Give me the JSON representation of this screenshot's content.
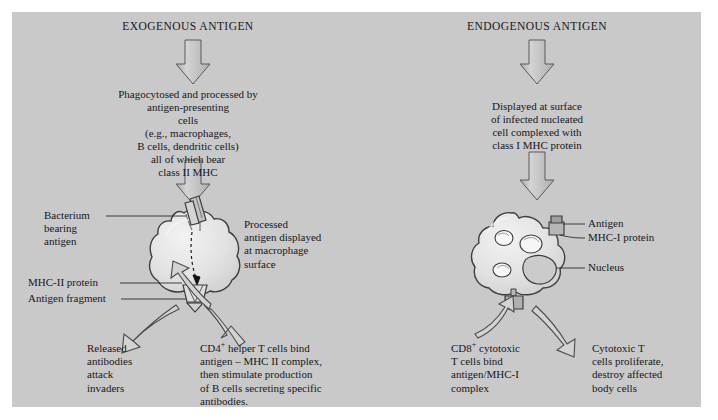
{
  "figure": {
    "background_color": "#c9c9c9",
    "page_color": "#ffffff",
    "ink_color": "#17171c",
    "shape_fill": "#d8d8d8",
    "shape_stroke": "#4a4a4a"
  },
  "left_pathway": {
    "header": "EXOGENOUS ANTIGEN",
    "step1": "Phagocytosed and processed by\nantigen-presenting\ncells\n(e.g., macrophages,\nB cells, dendritic cells)\nall of which bear\nclass II MHC",
    "cell_labels": {
      "bacterium": "Bacterium\nbearing\nantigen",
      "processed": "Processed\nantigen displayed\nat macrophage\nsurface",
      "mhc2": "MHC-II protein",
      "fragment": "Antigen fragment"
    },
    "outcome_left": "Released\nantibodies\nattack\ninvaders",
    "outcome_right": "CD4+ helper T cells bind\nantigen – MHC II complex,\nthen stimulate production\nof B cells secreting specific\nantibodies."
  },
  "right_pathway": {
    "header": "ENDOGENOUS ANTIGEN",
    "step1": "Displayed at surface\nof infected nucleated\ncell complexed with\nclass I MHC protein",
    "cell_labels": {
      "antigen": "Antigen",
      "mhc1": "MHC-I protein",
      "nucleus": "Nucleus"
    },
    "outcome_left": "CD8+ cytotoxic\nT cells bind\nantigen/MHC-I\ncomplex",
    "outcome_right": "Cytotoxic T\ncells proliferate,\ndestroy affected\nbody cells"
  }
}
